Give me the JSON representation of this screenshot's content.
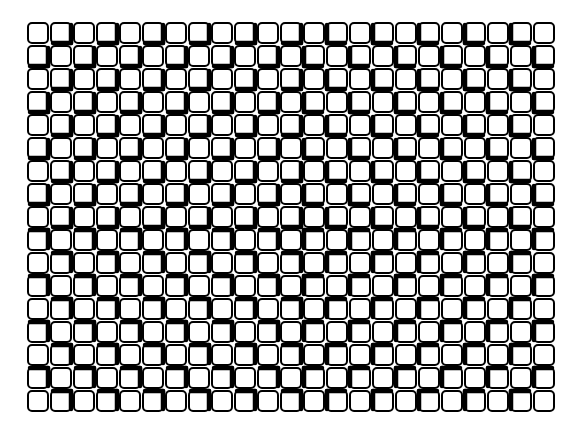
{
  "figure": {
    "type": "optical-illusion",
    "colors": {
      "background": "#ffffff",
      "stroke": "#000000"
    },
    "grid": {
      "cols": 23,
      "rows": 17,
      "cell": 23,
      "origin_x": 28,
      "origin_y": 23
    }
  }
}
